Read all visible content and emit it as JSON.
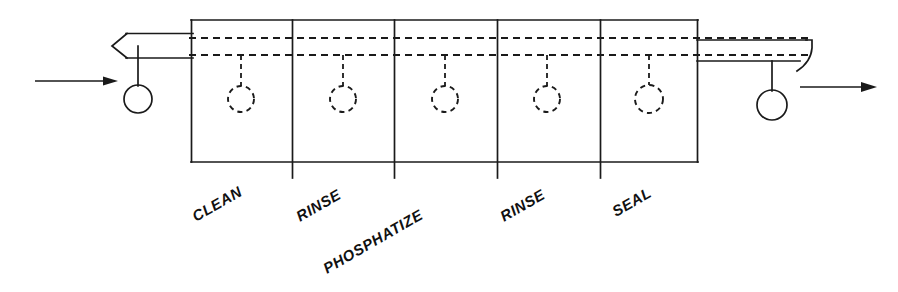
{
  "diagram": {
    "line_color": "#1a1a1a",
    "background_color": "#ffffff",
    "inlet_arrow": {
      "name": "inlet-flow-arrow",
      "direction": "right",
      "x1": 35,
      "y1": 81,
      "x2": 116,
      "y2": 81
    },
    "outlet_arrow": {
      "name": "outlet-flow-arrow",
      "direction": "right",
      "x1": 800,
      "y1": 87,
      "x2": 876,
      "y2": 87
    },
    "tank_box": {
      "x": 191,
      "y": 20,
      "width": 507,
      "height": 142
    },
    "conveyor": {
      "upper_rail_y": 38,
      "lower_rail_y": 55,
      "left_tail_x": 113,
      "right_tail_x": 812
    },
    "carriers": [
      {
        "name": "carrier-inlet",
        "cx": 138,
        "cy": 99,
        "r": 14,
        "style": "solid"
      },
      {
        "name": "carrier-clean",
        "cx": 241,
        "cy": 99,
        "r": 13,
        "style": "dashed"
      },
      {
        "name": "carrier-rinse-1",
        "cx": 343,
        "cy": 99,
        "r": 13,
        "style": "dashed"
      },
      {
        "name": "carrier-phosphatize",
        "cx": 445,
        "cy": 99,
        "r": 13,
        "style": "dashed"
      },
      {
        "name": "carrier-rinse-2",
        "cx": 547,
        "cy": 99,
        "r": 13,
        "style": "dashed"
      },
      {
        "name": "carrier-seal",
        "cx": 649,
        "cy": 99,
        "r": 14,
        "style": "dashed"
      },
      {
        "name": "carrier-outlet",
        "cx": 772,
        "cy": 105,
        "r": 15,
        "style": "solid"
      }
    ],
    "dividers": [
      292,
      394,
      497,
      600
    ],
    "stages": [
      {
        "id": "clean",
        "label": "CLEAN",
        "x": 196,
        "y": 222
      },
      {
        "id": "rinse-1",
        "label": "RINSE",
        "x": 300,
        "y": 222
      },
      {
        "id": "phosphatize",
        "label": "PHOSPHATIZE",
        "x": 327,
        "y": 274
      },
      {
        "id": "rinse-2",
        "label": "RINSE",
        "x": 504,
        "y": 222
      },
      {
        "id": "seal",
        "label": "SEAL",
        "x": 616,
        "y": 217
      }
    ],
    "label_rotation_deg": -30
  }
}
